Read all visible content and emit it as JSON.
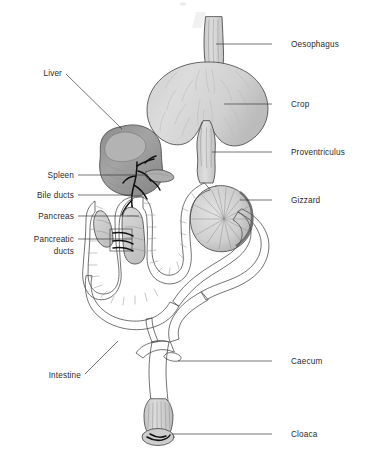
{
  "figure": {
    "background_color": "#ffffff",
    "line_color": "#3a3a3a",
    "organ_fill_light": "#d6d6d6",
    "organ_fill_mid": "#c4c4c4",
    "organ_fill_dark": "#9a9a9a",
    "liver_fill": "#8f8f8f",
    "duct_color": "#111111"
  },
  "labels": {
    "right": [
      {
        "name": "oesophagus",
        "text": "Oesophagus",
        "text_x": 291,
        "text_y": 47,
        "line_x1": 272,
        "line_y1": 44,
        "line_x2": 216,
        "line_y2": 44
      },
      {
        "name": "crop",
        "text": "Crop",
        "text_x": 291,
        "text_y": 107,
        "line_x1": 272,
        "line_y1": 104,
        "line_x2": 224,
        "line_y2": 104
      },
      {
        "name": "proventriculus",
        "text": "Proventriculus",
        "text_x": 291,
        "text_y": 155,
        "line_x1": 272,
        "line_y1": 152,
        "line_x2": 212,
        "line_y2": 152
      },
      {
        "name": "gizzard",
        "text": "Gizzard",
        "text_x": 291,
        "text_y": 203,
        "line_x1": 272,
        "line_y1": 200,
        "line_x2": 240,
        "line_y2": 200
      },
      {
        "name": "caecum",
        "text": "Caecum",
        "text_x": 291,
        "text_y": 364,
        "line_x1": 272,
        "line_y1": 361,
        "line_x2": 178,
        "line_y2": 361
      },
      {
        "name": "cloaca",
        "text": "Cloaca",
        "text_x": 291,
        "text_y": 437,
        "line_x1": 272,
        "line_y1": 434,
        "line_x2": 172,
        "line_y2": 434
      }
    ],
    "left": [
      {
        "name": "liver",
        "text": "Liver",
        "text_x": 60,
        "text_y": 76,
        "line_x1": 64,
        "line_y1": 76,
        "line_x2": 122,
        "line_y2": 129
      },
      {
        "name": "spleen",
        "text": "Spleen",
        "text_x": 74,
        "text_y": 178,
        "line_x1": 78,
        "line_y1": 175,
        "line_x2": 148,
        "line_y2": 175
      },
      {
        "name": "bile-ducts",
        "text": "Bile ducts",
        "text_x": 74,
        "text_y": 198,
        "line_x1": 78,
        "line_y1": 195,
        "line_x2": 131,
        "line_y2": 195
      },
      {
        "name": "pancreas",
        "text": "Pancreas",
        "text_x": 74,
        "text_y": 219,
        "line_x1": 78,
        "line_y1": 216,
        "line_x2": 139,
        "line_y2": 216
      },
      {
        "name": "pancreatic-ducts-line1",
        "text": "Pancreatic",
        "text_x": 74,
        "text_y": 242,
        "line_x1": 78,
        "line_y1": 239,
        "line_x2": 132,
        "line_y2": 239
      },
      {
        "name": "pancreatic-ducts-line2",
        "text": "ducts",
        "text_x": 74,
        "text_y": 254,
        "line_x1": null,
        "line_y1": null,
        "line_x2": null,
        "line_y2": null
      },
      {
        "name": "intestine",
        "text": "Intestine",
        "text_x": 79,
        "text_y": 378,
        "line_x1": 83,
        "line_y1": 375,
        "line_x2": 118,
        "line_y2": 341
      }
    ]
  }
}
